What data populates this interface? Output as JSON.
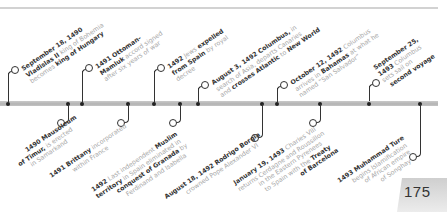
{
  "page_number": "175",
  "colors": {
    "timeline": "#bdbdbd",
    "text_muted": "#a8a8a8",
    "text_strong": "#333333",
    "page_tab": "#d8d8d8"
  },
  "events_top": [
    {
      "x": 8,
      "lead": "September 18, 1490",
      "lines": [
        [
          "Vladislas II",
          " king of Bohemia"
        ],
        [
          "becomes ",
          "king of Hungary"
        ]
      ]
    },
    {
      "x": 82,
      "lead": "1491 Ottoman-",
      "lines": [
        [
          "Mamluk",
          " accord signed"
        ],
        [
          "after six years of war",
          ""
        ]
      ]
    },
    {
      "x": 154,
      "lead": "1492",
      "lead_rest": " Jews ",
      "lead_bold2": "expelled",
      "lines": [
        [
          "from Spain",
          " by royal"
        ],
        [
          "decree",
          ""
        ]
      ]
    },
    {
      "x": 198,
      "lead": "August 3, 1492 Columbus,",
      "lead_rest": " in",
      "lines": [
        [
          "search of Asia, departs Canaries",
          ""
        ],
        [
          "and ",
          "crosses Atlantic",
          " to ",
          "New World"
        ]
      ]
    },
    {
      "x": 277,
      "lead": "October 12, 1492",
      "lead_rest": " Columbus",
      "lines": [
        [
          "arrives in ",
          "Bahamas",
          " at what he"
        ],
        [
          "named “San Salvador”",
          ""
        ]
      ]
    },
    {
      "x": 369,
      "lead": "September 25,",
      "lines": [
        [
          "1493",
          " Columbus"
        ],
        [
          "sets sail on",
          ""
        ],
        [
          "second voyage",
          ""
        ]
      ]
    }
  ],
  "events_bottom": [
    {
      "x": 68,
      "text": [
        [
          "1490 Mausoleum"
        ],
        [
          "of Timur,",
          " is erected"
        ],
        [
          "in Samarkand"
        ]
      ]
    },
    {
      "x": 128,
      "text": [
        [
          "1491 Brittany",
          " incorporated"
        ],
        [
          "within France"
        ]
      ]
    },
    {
      "x": 180,
      "text": [
        [
          "1492",
          " Last independent ",
          "Muslim"
        ],
        [
          "territory",
          " in Spain eliminated in"
        ],
        [
          "conquest of Granada",
          " by"
        ],
        [
          "Ferdinand and Isabella"
        ]
      ]
    },
    {
      "x": 262,
      "text": [
        [
          "August 18, 1492 Rodrigo Borgia"
        ],
        [
          "crowned Pope Alexander VI"
        ]
      ]
    },
    {
      "x": 320,
      "text": [
        [
          "January 19, 1493",
          " Charles VIII"
        ],
        [
          "returns Cerdagne and Roussillon"
        ],
        [
          "in the Eastern Pyrenees"
        ],
        [
          "to Spain with the ",
          "Treaty"
        ],
        [
          "of Barcelona"
        ]
      ]
    },
    {
      "x": 420,
      "text": [
        [
          "1493 Muhammad Ture"
        ],
        [
          "begins Islamification"
        ],
        [
          "of African empire"
        ],
        [
          "of Songhay"
        ]
      ]
    }
  ]
}
